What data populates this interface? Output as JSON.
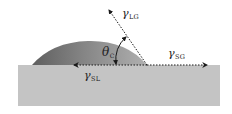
{
  "diagram": {
    "colors": {
      "background": "#ffffff",
      "substrate": "#c4c4c4",
      "droplet_dark": "#6e6e6e",
      "droplet_light": "#a8a8a8",
      "arrows": "#1a1a1a",
      "text": "#222222"
    },
    "labels": {
      "gamma_lg": {
        "symbol": "γ",
        "subscript": "LG"
      },
      "gamma_sg": {
        "symbol": "γ",
        "subscript": "SG"
      },
      "gamma_sl": {
        "symbol": "γ",
        "subscript": "SL"
      },
      "theta_c": {
        "symbol": "θ",
        "subscript": "C"
      }
    },
    "vectors": [
      {
        "name": "gamma_lg",
        "from": [
          147,
          65
        ],
        "to": [
          108,
          9
        ],
        "style": "dotted",
        "arrowhead": "end"
      },
      {
        "name": "gamma_sg",
        "from": [
          147,
          65
        ],
        "to": [
          208,
          65
        ],
        "style": "dotted",
        "arrowhead": "end"
      },
      {
        "name": "gamma_sl",
        "from": [
          147,
          65
        ],
        "to": [
          72,
          65
        ],
        "style": "dotted",
        "arrowhead": "end"
      }
    ],
    "angle_arc": {
      "center": [
        147,
        65
      ],
      "arrowheads": "both"
    }
  }
}
